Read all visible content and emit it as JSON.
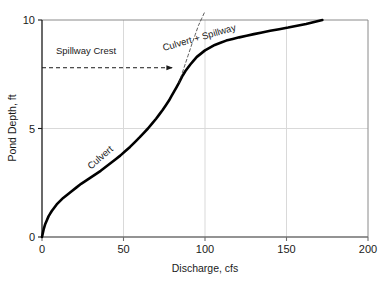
{
  "chart_data": {
    "type": "line",
    "title": "",
    "subtitle": "",
    "xlabel": "Discharge, cfs",
    "ylabel": "Pond Depth, ft",
    "xlim": [
      0,
      200
    ],
    "ylim": [
      0,
      10
    ],
    "xticks": [
      0,
      50,
      100,
      150,
      200
    ],
    "xtick_labels": [
      "0",
      "50",
      "100",
      "150",
      "200"
    ],
    "yticks": [
      0,
      5,
      10
    ],
    "ytick_labels": [
      "0",
      "5",
      "10"
    ],
    "grid": true,
    "grid_x": [
      50,
      100,
      150
    ],
    "grid_y": [
      5
    ],
    "legend": "none",
    "legend_position": "none",
    "series": [
      {
        "name": "Stage-Discharge Rating Curve",
        "style": "solid-thick-black",
        "color": "#000000",
        "x": [
          0,
          1,
          2,
          4,
          6,
          9,
          13,
          18,
          24,
          30,
          36,
          42,
          48,
          54,
          60,
          65,
          70,
          74,
          78,
          81,
          84,
          86,
          88,
          91,
          95,
          100,
          106,
          113,
          121,
          130,
          140,
          151,
          162,
          172
        ],
        "y": [
          0,
          0.35,
          0.6,
          0.95,
          1.2,
          1.5,
          1.8,
          2.1,
          2.45,
          2.75,
          3.05,
          3.4,
          3.75,
          4.15,
          4.6,
          5.0,
          5.45,
          5.85,
          6.3,
          6.7,
          7.1,
          7.4,
          7.65,
          7.95,
          8.3,
          8.6,
          8.85,
          9.05,
          9.2,
          9.35,
          9.5,
          9.65,
          9.82,
          10.0
        ]
      },
      {
        "name": "Culvert-only extrapolation (tangent)",
        "style": "thin-dashed-black",
        "color": "#333333",
        "x": [
          84,
          88,
          92,
          96,
          100
        ],
        "y": [
          7.1,
          8.0,
          8.9,
          9.75,
          10.4
        ]
      }
    ],
    "annotations": [
      {
        "name": "spillway-crest",
        "text": "Spillway Crest",
        "kind": "arrow-label",
        "arrow_from_x": 0,
        "arrow_to_x": 80,
        "arrow_y": 7.8,
        "arrow_style": "dashed",
        "text_x": 27,
        "text_y": 8.45,
        "rotation": 0
      },
      {
        "name": "culvert-curve-label",
        "text": "Culvert",
        "kind": "inline-curve-label",
        "x": 37,
        "y": 3.55,
        "rotation": -41
      },
      {
        "name": "culvert-plus-spillway-curve-label",
        "text": "Culvert + Spillway",
        "kind": "inline-curve-label",
        "x": 97,
        "y": 9.05,
        "rotation": -16
      }
    ],
    "axis_color": "#7a7a7a",
    "grid_color": "#d9d9d9",
    "curve_color": "#000000",
    "background": "#ffffff"
  },
  "figure": {
    "x_axis_title": "Discharge, cfs",
    "y_axis_title": "Pond Depth, ft"
  }
}
